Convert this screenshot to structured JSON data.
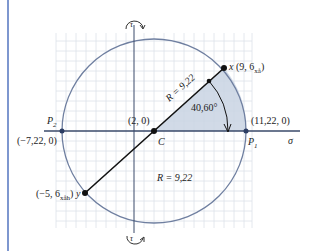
{
  "diagram": {
    "type": "mohr-circle",
    "axes": {
      "horizontal": "σ",
      "vertical": "τ"
    },
    "center": {
      "label": "C",
      "coords": "(2, 0)"
    },
    "radius_label_upper": "R = 9,22",
    "radius_label_lower": "R = 9,22",
    "angle_label": "40,60°",
    "points": {
      "x": {
        "name": "x",
        "coords": "(9, 6",
        "sub": "xå",
        "close": ")"
      },
      "y": {
        "coords": "(−5, 6",
        "sub": "xåh",
        "close": ")",
        "name": "y"
      },
      "p1": {
        "name": "P",
        "sub": "1",
        "coords": "(11,22, 0)"
      },
      "p2": {
        "name": "P",
        "sub": "2",
        "coords": "(−7,22, 0)"
      }
    },
    "colors": {
      "circle": "#6f7fa0",
      "fill": "#c9d3e3",
      "grid": "#d8dde6",
      "axis": "#3a4a6a",
      "line": "#111111",
      "side_bar": "#7e97cf"
    }
  }
}
